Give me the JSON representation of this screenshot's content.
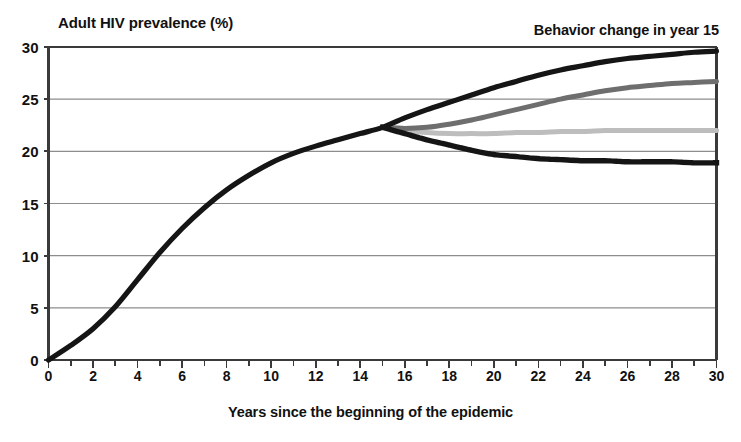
{
  "chart_data": {
    "type": "line",
    "title": "",
    "annotation": "Behavior change in year 15",
    "ylabel": "Adult HIV prevalence (%)",
    "xlabel": "Years since the beginning of the epidemic",
    "xlim": [
      0,
      30
    ],
    "ylim": [
      0,
      30
    ],
    "xticks": [
      0,
      2,
      4,
      6,
      8,
      10,
      12,
      14,
      16,
      18,
      20,
      22,
      24,
      26,
      28,
      30
    ],
    "yticks": [
      0,
      5,
      10,
      15,
      20,
      25,
      30
    ],
    "grid": "horizontal",
    "legend_position": "none",
    "branch_year": 15,
    "branch_value": 22.3,
    "x": [
      0,
      1,
      2,
      3,
      4,
      5,
      6,
      7,
      8,
      9,
      10,
      11,
      12,
      13,
      14,
      15,
      16,
      17,
      18,
      19,
      20,
      21,
      22,
      23,
      24,
      25,
      26,
      27,
      28,
      29,
      30
    ],
    "series": [
      {
        "name": "No behavior change (baseline)",
        "style": "solid",
        "color": "#151515",
        "width": 5.2,
        "values": [
          0.0,
          1.4,
          3.0,
          5.1,
          7.7,
          10.3,
          12.6,
          14.6,
          16.3,
          17.7,
          18.9,
          19.8,
          20.5,
          21.1,
          21.7,
          22.3,
          23.2,
          24.0,
          24.7,
          25.4,
          26.1,
          26.7,
          27.3,
          27.8,
          28.2,
          28.6,
          28.9,
          29.1,
          29.3,
          29.5,
          29.6
        ]
      },
      {
        "name": "Small behavior change",
        "style": "solid",
        "color": "#6e6e6e",
        "width": 5.0,
        "values": [
          null,
          null,
          null,
          null,
          null,
          null,
          null,
          null,
          null,
          null,
          null,
          null,
          null,
          null,
          null,
          22.3,
          22.2,
          22.3,
          22.6,
          23.0,
          23.5,
          24.0,
          24.5,
          25.0,
          25.4,
          25.8,
          26.1,
          26.3,
          26.5,
          26.6,
          26.7
        ]
      },
      {
        "name": "Moderate behavior change",
        "style": "solid",
        "color": "#bdbdbd",
        "width": 5.0,
        "values": [
          null,
          null,
          null,
          null,
          null,
          null,
          null,
          null,
          null,
          null,
          null,
          null,
          null,
          null,
          null,
          22.3,
          22.0,
          21.8,
          21.7,
          21.7,
          21.7,
          21.8,
          21.8,
          21.9,
          21.9,
          22.0,
          22.0,
          22.0,
          22.0,
          22.0,
          22.0
        ]
      },
      {
        "name": "Large behavior change",
        "style": "dotted",
        "color": "#151515",
        "width": 5.4,
        "values": [
          null,
          null,
          null,
          null,
          null,
          null,
          null,
          null,
          null,
          null,
          null,
          null,
          null,
          null,
          null,
          22.3,
          21.7,
          21.1,
          20.6,
          20.1,
          19.7,
          19.5,
          19.3,
          19.2,
          19.1,
          19.1,
          19.0,
          19.0,
          19.0,
          18.9,
          18.9
        ]
      }
    ]
  },
  "colors": {
    "axis": "#3a3a3a",
    "grid": "#8d8d8d",
    "text": "#111111",
    "series_baseline": "#151515",
    "series_small": "#6e6e6e",
    "series_moderate": "#bdbdbd",
    "series_large": "#151515"
  }
}
